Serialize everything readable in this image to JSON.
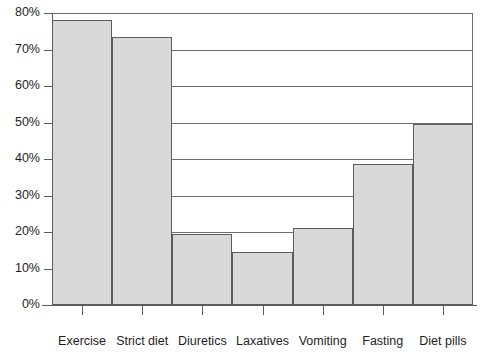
{
  "chart_data": {
    "type": "bar",
    "title": "",
    "subtitle": "",
    "xlabel": "",
    "ylabel": "",
    "categories": [
      "Exercise",
      "Strict diet",
      "Diuretics",
      "Laxatives",
      "Vomiting",
      "Fasting",
      "Diet pills"
    ],
    "values": [
      78,
      73.5,
      19.5,
      14.5,
      21,
      38.5,
      49.5
    ],
    "value_labels": [
      "78%",
      "73.5%",
      "19.5%",
      "14.5%",
      "21%",
      "38.5%",
      "49.5%"
    ],
    "ylim": [
      0,
      80
    ],
    "y_ticks": [
      0,
      10,
      20,
      30,
      40,
      50,
      60,
      70,
      80
    ],
    "y_tick_labels": [
      "0%",
      "10%",
      "20%",
      "30%",
      "40%",
      "50%",
      "60%",
      "70%",
      "80%"
    ],
    "grid": true,
    "grid_axis": "y",
    "legend": false,
    "legend_position": "none",
    "bar_fill_color": "#d9d9d9",
    "bar_border_color": "#5c5c5c",
    "axis_color": "#5c5c5c",
    "background_color": "#ffffff"
  }
}
